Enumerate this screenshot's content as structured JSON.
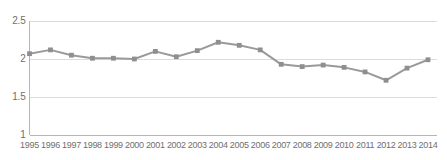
{
  "chart_data": {
    "type": "line",
    "title": "",
    "subtitle": "",
    "xlabel": "",
    "ylabel": "",
    "categories": [
      "1995",
      "1996",
      "1997",
      "1998",
      "1999",
      "2000",
      "2001",
      "2002",
      "2003",
      "2004",
      "2005",
      "2006",
      "2007",
      "2008",
      "2009",
      "2010",
      "2011",
      "2012",
      "2013",
      "2014"
    ],
    "values": [
      2.07,
      2.12,
      2.05,
      2.01,
      2.01,
      2.0,
      2.1,
      2.03,
      2.11,
      2.22,
      2.18,
      2.12,
      1.93,
      1.9,
      1.92,
      1.89,
      1.83,
      1.72,
      1.88,
      1.99
    ],
    "series": [
      {
        "name": "",
        "values": [
          2.07,
          2.12,
          2.05,
          2.01,
          2.01,
          2.0,
          2.1,
          2.03,
          2.11,
          2.22,
          2.18,
          2.12,
          1.93,
          1.9,
          1.92,
          1.89,
          1.83,
          1.72,
          1.88,
          1.99
        ]
      }
    ],
    "ylim": [
      1,
      2.5
    ],
    "yticks": [
      "1",
      "1.5",
      "2",
      "2.5"
    ],
    "ytick_values": [
      1,
      1.5,
      2,
      2.5
    ],
    "xticks": [
      "1995",
      "1996",
      "1997",
      "1998",
      "1999",
      "2000",
      "2001",
      "2002",
      "2003",
      "2004",
      "2005",
      "2006",
      "2007",
      "2008",
      "2009",
      "2010",
      "2011",
      "2012",
      "2013",
      "2014"
    ],
    "grid": true,
    "grid_axis": "y",
    "legend": false,
    "legend_position": "none",
    "markers": "square",
    "annotations": []
  },
  "style": {
    "line_color": "#9a9a9a",
    "marker_color": "#8f8f8f",
    "grid_color": "#dcdcdc",
    "axis_color": "#b5b5b5",
    "tick_label_color": "#6f6f6f",
    "background": "#ffffff"
  }
}
